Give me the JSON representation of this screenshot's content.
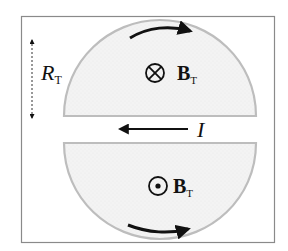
{
  "diagram": {
    "colors": {
      "frame": "#8a8a8a",
      "disk_fill": "#f2f2f2",
      "disk_edge": "#bdbdbd",
      "arrow": "#111111",
      "text": "#111111"
    },
    "radius_marker": {
      "label_main": "R",
      "label_sub": "T"
    },
    "upper_region": {
      "symbol": "⊗",
      "symbol_meaning": "into-page",
      "field_label_main": "B",
      "field_label_sub": "T",
      "arc_arrow_direction": "clockwise"
    },
    "lower_region": {
      "symbol": "⊙",
      "symbol_meaning": "out-of-page",
      "field_label_main": "B",
      "field_label_sub": "T",
      "arc_arrow_direction": "counterclockwise"
    },
    "current": {
      "label": "I",
      "direction": "left"
    }
  }
}
